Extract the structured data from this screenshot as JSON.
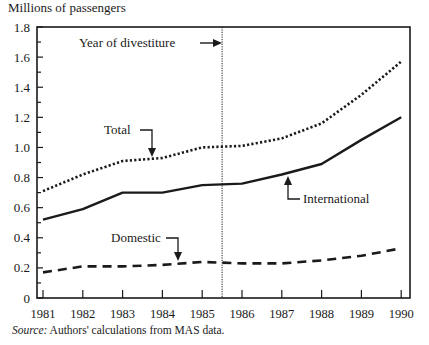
{
  "chart_data": {
    "type": "line",
    "title": "",
    "xlabel": "",
    "ylabel": "Millions of passengers",
    "ylim": [
      0,
      1.8
    ],
    "yticks": [
      "0",
      "0.2",
      "0.4",
      "0.6",
      "0.8",
      "1.0",
      "1.2",
      "1.4",
      "1.6",
      "1.8"
    ],
    "categories": [
      "1981",
      "1982",
      "1983",
      "1984",
      "1985",
      "1986",
      "1987",
      "1988",
      "1989",
      "1990"
    ],
    "series": [
      {
        "name": "Total",
        "style": "dotted",
        "values": [
          0.71,
          0.82,
          0.91,
          0.93,
          1.0,
          1.01,
          1.06,
          1.16,
          1.35,
          1.57
        ]
      },
      {
        "name": "International",
        "style": "solid",
        "values": [
          0.52,
          0.59,
          0.7,
          0.7,
          0.75,
          0.76,
          0.82,
          0.89,
          1.05,
          1.2
        ]
      },
      {
        "name": "Domestic",
        "style": "dashed",
        "values": [
          0.17,
          0.21,
          0.21,
          0.22,
          0.24,
          0.23,
          0.23,
          0.25,
          0.28,
          0.33
        ]
      }
    ],
    "annotations": [
      {
        "text": "Year of divestiture",
        "x": 1985.5,
        "type": "vertical-dotted-line"
      },
      {
        "text": "Total",
        "points_to": "Total series near 1984"
      },
      {
        "text": "International",
        "points_to": "International series near 1987"
      },
      {
        "text": "Domestic",
        "points_to": "Domestic series near 1984.5"
      }
    ],
    "grid": false,
    "legend": "inline labels with arrows"
  },
  "labels": {
    "y_axis_title": "Millions of passengers",
    "divestiture": "Year of divestiture",
    "total": "Total",
    "international": "International",
    "domestic": "Domestic",
    "source_prefix": "Source:",
    "source_text": " Authors' calculations from MAS data."
  }
}
